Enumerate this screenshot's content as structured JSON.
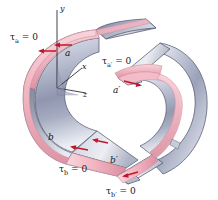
{
  "figure": {
    "background_color": "#ffffff",
    "colors": {
      "shell_outer_light": "#c9cede",
      "shell_outer_dark": "#5a6078",
      "shell_inner_light": "#dde0ea",
      "edge_pink": "#f0b9c4",
      "edge_pink_dark": "#d98b9c",
      "arrow_red": "#c0172b",
      "outline": "#3a3a48",
      "text": "#16161c",
      "axis_line": "#2b2b38"
    },
    "left_section": {
      "name": "left-channel-section",
      "axes": [
        {
          "name": "y-axis",
          "label": "y"
        },
        {
          "name": "x-axis",
          "label": "x"
        },
        {
          "name": "z-axis",
          "label": "z"
        }
      ],
      "labels": {
        "tau_a": {
          "tau": "τ",
          "sub": "a",
          "eq": " = 0"
        },
        "tau_b": {
          "tau": "τ",
          "sub": "b",
          "eq": " = 0"
        },
        "point_a": "a",
        "point_b": "b"
      },
      "shear_arrows": [
        {
          "name": "shear-arrow-top-outer",
          "direction": "left"
        },
        {
          "name": "shear-arrow-top-inner",
          "direction": "left"
        },
        {
          "name": "shear-arrow-bottom-outer",
          "direction": "left"
        },
        {
          "name": "shear-arrow-bottom-inner",
          "direction": "left"
        }
      ]
    },
    "right_section": {
      "name": "right-channel-section",
      "labels": {
        "tau_a_prime": {
          "tau": "τ",
          "sub": "a′",
          "eq": " = 0"
        },
        "tau_b_prime": {
          "tau": "τ",
          "sub": "b′",
          "eq": " = 0"
        },
        "point_a_prime": "a′",
        "point_b_prime": "b′"
      },
      "shear_arrows": [
        {
          "name": "shear-arrow-top-prime",
          "direction": "right"
        },
        {
          "name": "shear-arrow-bottom-prime",
          "direction": "left"
        }
      ]
    }
  }
}
